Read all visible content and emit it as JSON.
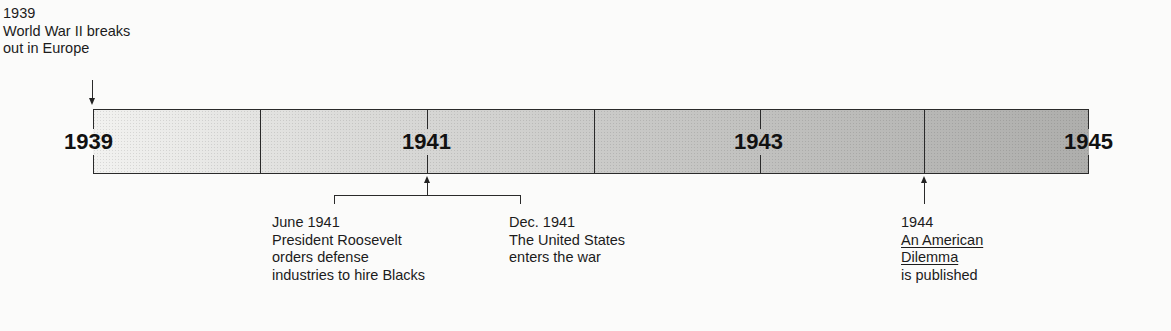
{
  "timeline": {
    "start_year": "1939",
    "end_year": "1945",
    "year_labels": [
      {
        "label": "1939",
        "x": 64
      },
      {
        "label": "1941",
        "x": 402
      },
      {
        "label": "1943",
        "x": 734
      },
      {
        "label": "1945",
        "x": 1064
      }
    ],
    "colors": {
      "bar_start": "#f2f2f0",
      "bar_end": "#aeaeac",
      "lines": "#2a2a2a",
      "text": "#1c1c1c"
    }
  },
  "events": {
    "ww2": {
      "date": "1939",
      "lines": [
        "World War II breaks",
        "out in Europe"
      ]
    },
    "june1941": {
      "date": "June 1941",
      "lines": [
        "President Roosevelt",
        "orders defense",
        "industries to hire Blacks"
      ]
    },
    "dec1941": {
      "date": "Dec. 1941",
      "lines": [
        "The United States",
        "enters the war"
      ]
    },
    "y1944": {
      "date": "1944",
      "title_lines": [
        "An American",
        "Dilemma"
      ],
      "lines": [
        "is published"
      ]
    }
  }
}
